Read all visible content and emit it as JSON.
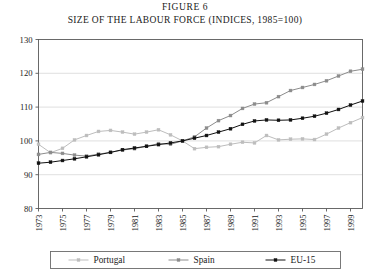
{
  "figure": {
    "number_label": "FIGURE 6",
    "title": "SIZE OF THE LABOUR FORCE (INDICES, 1985=100)"
  },
  "chart_data": {
    "type": "line",
    "title": "SIZE OF THE LABOUR FORCE (INDICES, 1985=100)",
    "subtitle": "FIGURE 6",
    "xlabel": "",
    "ylabel": "",
    "xlim": [
      1973,
      2000
    ],
    "ylim": [
      80,
      130
    ],
    "yticks": [
      80,
      90,
      100,
      110,
      120,
      130
    ],
    "grid": true,
    "grid_axis": "y",
    "legend_position": "bottom",
    "x": [
      1973,
      1974,
      1975,
      1976,
      1977,
      1978,
      1979,
      1980,
      1981,
      1982,
      1983,
      1984,
      1985,
      1986,
      1987,
      1988,
      1989,
      1990,
      1991,
      1992,
      1993,
      1994,
      1995,
      1996,
      1997,
      1998,
      1999,
      2000
    ],
    "xticks": [
      1973,
      1975,
      1977,
      1979,
      1981,
      1983,
      1985,
      1987,
      1989,
      1991,
      1993,
      1995,
      1997,
      1999
    ],
    "xtick_labels": [
      "1973",
      "1975",
      "1977",
      "1979",
      "1981",
      "1983",
      "1985",
      "1987",
      "1989",
      "1991",
      "1993",
      "1995",
      "1997",
      "1999"
    ],
    "series": [
      {
        "name": "Portugal",
        "color": "#bdbdbd",
        "marker": "square",
        "values": [
          99.0,
          96.5,
          97.8,
          100.3,
          101.6,
          102.8,
          103.1,
          102.6,
          102.0,
          102.6,
          103.3,
          101.8,
          100.0,
          97.7,
          98.1,
          98.3,
          99.0,
          99.6,
          99.4,
          101.6,
          100.3,
          100.5,
          100.6,
          100.4,
          102.0,
          103.8,
          105.4,
          106.9
        ]
      },
      {
        "name": "Spain",
        "color": "#8c8c8c",
        "marker": "square",
        "values": [
          96.0,
          96.6,
          96.3,
          95.8,
          95.5,
          96.1,
          96.6,
          97.3,
          97.7,
          98.4,
          99.2,
          99.0,
          100.0,
          101.2,
          103.8,
          106.0,
          107.5,
          109.6,
          110.9,
          111.3,
          113.1,
          114.9,
          115.8,
          116.7,
          117.8,
          119.2,
          120.6,
          121.2
        ]
      },
      {
        "name": "EU-15",
        "color": "#111111",
        "marker": "square",
        "values": [
          93.4,
          93.7,
          94.2,
          94.7,
          95.3,
          95.9,
          96.6,
          97.4,
          97.9,
          98.4,
          98.9,
          99.4,
          100.0,
          100.8,
          101.6,
          102.6,
          103.6,
          104.9,
          105.9,
          106.2,
          106.1,
          106.2,
          106.7,
          107.3,
          108.2,
          109.3,
          110.6,
          111.8
        ]
      }
    ]
  },
  "legend": {
    "items": [
      {
        "label": "Portugal",
        "color": "#bdbdbd"
      },
      {
        "label": "Spain",
        "color": "#8c8c8c"
      },
      {
        "label": "EU-15",
        "color": "#111111"
      }
    ]
  }
}
